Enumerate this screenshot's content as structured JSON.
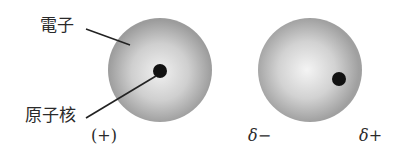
{
  "diagram": {
    "labels": {
      "electron": "電子",
      "nucleus": "原子核",
      "nucleus_charge": "(+)",
      "partial_negative": "δ−",
      "partial_positive": "δ+"
    },
    "atoms": [
      {
        "name": "neutral-atom",
        "cx": 160,
        "cy": 70,
        "r": 52,
        "nucleus": {
          "cx": 160,
          "cy": 71,
          "r": 7
        }
      },
      {
        "name": "polarized-atom",
        "cx": 310,
        "cy": 70,
        "r": 52,
        "nucleus": {
          "cx": 339,
          "cy": 79,
          "r": 7
        }
      }
    ],
    "colors": {
      "cloud_center": "#f2f2f2",
      "cloud_edge": "#9a9a9a",
      "nucleus": "#111111",
      "leader_line": "#222222",
      "text": "#2a2a2a"
    }
  }
}
